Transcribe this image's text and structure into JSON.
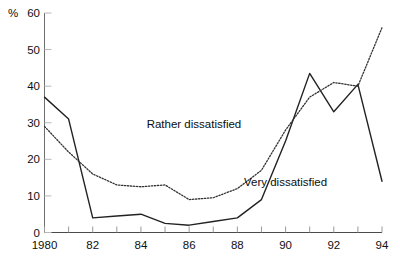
{
  "chart_data": {
    "type": "line",
    "title": "",
    "xlabel": "",
    "ylabel": "%",
    "ylim": [
      0,
      60
    ],
    "xlim": [
      1980,
      1994
    ],
    "grid": false,
    "legend_position": "inline-annotations",
    "x": [
      1980,
      1981,
      1982,
      1983,
      1984,
      1985,
      1986,
      1987,
      1988,
      1989,
      1990,
      1991,
      1992,
      1993,
      1994
    ],
    "y_ticks": [
      0,
      10,
      20,
      30,
      40,
      50,
      60
    ],
    "x_ticks": [
      1980,
      1981,
      1982,
      1983,
      1984,
      1985,
      1986,
      1987,
      1988,
      1989,
      1990,
      1991,
      1992,
      1993,
      1994
    ],
    "x_tick_labels": [
      "1980",
      "",
      "82",
      "",
      "84",
      "",
      "86",
      "",
      "88",
      "",
      "90",
      "",
      "92",
      "",
      "94"
    ],
    "y_tick_labels": [
      "0",
      "10",
      "20",
      "30",
      "40",
      "50",
      "60"
    ],
    "series": [
      {
        "name": "Very dissatisfied",
        "style": "solid",
        "color": "#222222",
        "values": [
          37,
          31,
          4,
          4.5,
          5,
          2.5,
          2,
          3,
          4,
          9,
          25,
          43.5,
          33,
          40.5,
          14
        ]
      },
      {
        "name": "Rather dissatisfied",
        "style": "dotted",
        "color": "#333333",
        "values": [
          29,
          22,
          16,
          13,
          12.5,
          13,
          9,
          9.5,
          12,
          17,
          28,
          37,
          41,
          40,
          56
        ]
      }
    ],
    "annotations": [
      {
        "text": "Rather dissatisfied",
        "x": 1986.2,
        "y": 29.5
      },
      {
        "text": "Very dissatisfied",
        "x": 1990.0,
        "y": 13.5
      }
    ]
  },
  "axis": {
    "unit": "%"
  }
}
